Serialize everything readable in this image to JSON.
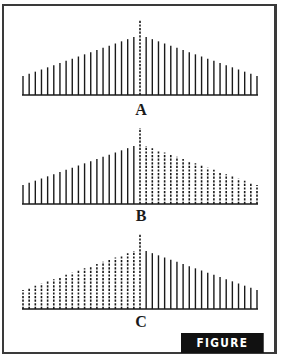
{
  "figure": {
    "tag": "FIGURE 8.10",
    "colors": {
      "ink": "#1a1a1a",
      "frame": "#3a3a3a",
      "tag_bg": "#111111",
      "tag_text": "#ffffff"
    }
  },
  "panels": [
    {
      "id": "A",
      "label": "A",
      "left_style": "solid",
      "right_style": "solid",
      "center_style": "dashed",
      "baseline_y": 95,
      "top_y": 20
    },
    {
      "id": "B",
      "label": "B",
      "left_style": "solid",
      "right_style": "dashed",
      "center_style": "dashed",
      "baseline_y": 204,
      "top_y": 128
    },
    {
      "id": "C",
      "label": "C",
      "left_style": "dashed",
      "right_style": "solid",
      "center_style": "dashed",
      "baseline_y": 309,
      "top_y": 234
    }
  ],
  "bars": {
    "count_per_side": 19,
    "x_start": 23,
    "x_center": 140,
    "x_end": 257,
    "outer_height": 19,
    "inner_height": 58,
    "center_height": 75
  }
}
